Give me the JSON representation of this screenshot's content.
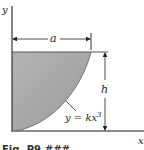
{
  "figure": {
    "axis_labels": {
      "x": "x",
      "y": "y"
    },
    "dimensions": {
      "width": "a",
      "height": "h"
    },
    "curve_equation_prefix": "y = kx",
    "curve_equation_exponent": "3",
    "caption": "Fig. P9.###",
    "colors": {
      "fill": "#a9a9a9",
      "line": "#555555",
      "axis": "#333333"
    }
  }
}
